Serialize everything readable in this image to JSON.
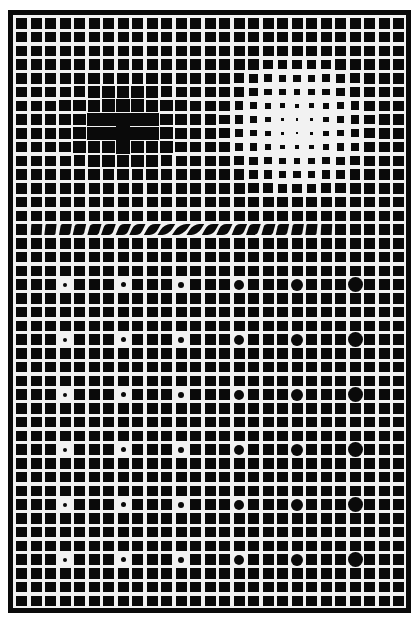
{
  "artwork": {
    "description": "Op-art grid of black squares on white lattice with a dark blob, a light blob, a wave distortion row, and a field of growing dots",
    "colors": {
      "ink": "#0a0a0a",
      "paper": "#f2f2f2",
      "background": "#ffffff"
    },
    "grid": {
      "cols": 27,
      "rows": 43,
      "pitch_x": 14.5,
      "pitch_y": 13.75,
      "square_w": 11,
      "square_h": 10.5,
      "origin_x": 3,
      "origin_y": 3
    },
    "dark_blob": {
      "center_col": 7,
      "center_row": 7.5,
      "radius_cells": 4.5
    },
    "light_blob": {
      "center_col": 19,
      "center_row": 7.5,
      "radius_cells": 5.5
    },
    "wave_row": {
      "row": 15,
      "from_col": 1,
      "to_col": 21
    },
    "dots": {
      "cols": [
        3,
        7,
        11,
        15,
        19,
        23
      ],
      "rows": [
        19,
        23,
        27,
        31,
        35,
        39
      ],
      "diameters": [
        4,
        5,
        6,
        10,
        12,
        15
      ]
    }
  }
}
